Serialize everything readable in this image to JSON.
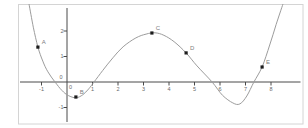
{
  "figure": {
    "width": 308,
    "height": 128,
    "background_color": "#ffffff",
    "frame_color": "#d4d4d4",
    "axis_color": "#4a4a4a",
    "tick_label_color": "#6a6a6a",
    "curve_color": "#9c9c9c",
    "point_color": "#1c1c1c",
    "point_label_color": "#7d7d7d"
  },
  "chart_data": {
    "type": "line",
    "title": "",
    "xlabel": "",
    "ylabel": "",
    "grid": false,
    "legend": null,
    "xlim": [
      -1.92,
      9.45
    ],
    "ylim": [
      -1.8,
      3.06
    ],
    "x_ticks": [
      -1,
      0,
      1,
      2,
      3,
      4,
      5,
      6,
      7,
      8
    ],
    "y_ticks": [
      -1,
      0,
      1,
      2
    ],
    "curve_samples": [
      [
        -1.49,
        3.06
      ],
      [
        -1.32,
        2.15
      ],
      [
        -1.14,
        1.37
      ],
      [
        -0.95,
        0.82
      ],
      [
        -0.75,
        0.4
      ],
      [
        -0.47,
        0.0
      ],
      [
        -0.2,
        -0.33
      ],
      [
        0.05,
        -0.53
      ],
      [
        0.35,
        -0.62
      ],
      [
        0.62,
        -0.5
      ],
      [
        0.85,
        -0.27
      ],
      [
        1.06,
        0.0
      ],
      [
        1.4,
        0.45
      ],
      [
        1.8,
        0.95
      ],
      [
        2.2,
        1.38
      ],
      [
        2.7,
        1.73
      ],
      [
        3.1,
        1.88
      ],
      [
        3.45,
        1.93
      ],
      [
        3.8,
        1.83
      ],
      [
        4.2,
        1.58
      ],
      [
        4.67,
        1.14
      ],
      [
        5.1,
        0.63
      ],
      [
        5.69,
        0.0
      ],
      [
        6.1,
        -0.52
      ],
      [
        6.5,
        -0.82
      ],
      [
        6.78,
        -0.86
      ],
      [
        7.05,
        -0.55
      ],
      [
        7.33,
        0.0
      ],
      [
        7.65,
        0.59
      ],
      [
        7.95,
        1.45
      ],
      [
        8.2,
        2.25
      ],
      [
        8.47,
        3.06
      ]
    ],
    "points": [
      {
        "label": "A",
        "x": -1.14,
        "y": 1.37
      },
      {
        "label": "B",
        "x": 0.35,
        "y": -0.59
      },
      {
        "label": "C",
        "x": 3.33,
        "y": 1.92
      },
      {
        "label": "D",
        "x": 4.67,
        "y": 1.14
      },
      {
        "label": "E",
        "x": 7.65,
        "y": 0.59
      }
    ],
    "transform_px": {
      "origin": [
        67,
        82
      ],
      "unit": 25.5,
      "frame": [
        18.5,
        4.5,
        284.5,
        119.5
      ],
      "x_axis_span": [
        20,
        300.5
      ],
      "y_axis_span": [
        8,
        122
      ]
    }
  }
}
